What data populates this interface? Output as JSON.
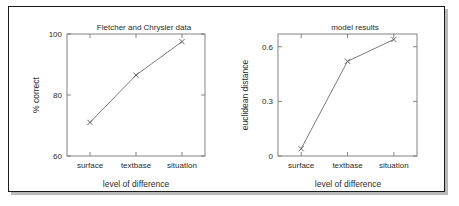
{
  "figure": {
    "window_label": "figure-window",
    "background": "#ffffff",
    "border_color": "#1a1a1a",
    "shadow_color": "#b9b9b9"
  },
  "chart_data": [
    {
      "type": "line",
      "id": "fletcher-chrysler",
      "title": "Fletcher and Chrysler data",
      "xlabel": "level of difference",
      "ylabel": "% correct",
      "categories": [
        "surface",
        "textbase",
        "situation"
      ],
      "values": [
        71,
        86.5,
        97.5
      ],
      "ylim": [
        60,
        100
      ],
      "yticks": [
        60,
        80,
        100
      ],
      "ytick_labels": [
        "60",
        "80",
        "100"
      ],
      "xtick_labels": [
        "surface",
        "textbase",
        "situation"
      ],
      "grid": false,
      "legend": null,
      "marker": "x",
      "line_color": "#6b6b6b"
    },
    {
      "type": "line",
      "id": "model-results",
      "title": "model results",
      "xlabel": "level of difference",
      "ylabel": "euclidean distance",
      "categories": [
        "surface",
        "textbase",
        "situation"
      ],
      "values": [
        0.04,
        0.52,
        0.64
      ],
      "ylim": [
        0,
        0.67
      ],
      "yticks": [
        0,
        0.3,
        0.6
      ],
      "ytick_labels": [
        "0",
        "0.3",
        "0.6"
      ],
      "xtick_labels": [
        "surface",
        "textbase",
        "situation"
      ],
      "grid": false,
      "legend": null,
      "marker": "x",
      "line_color": "#6b6b6b"
    }
  ]
}
